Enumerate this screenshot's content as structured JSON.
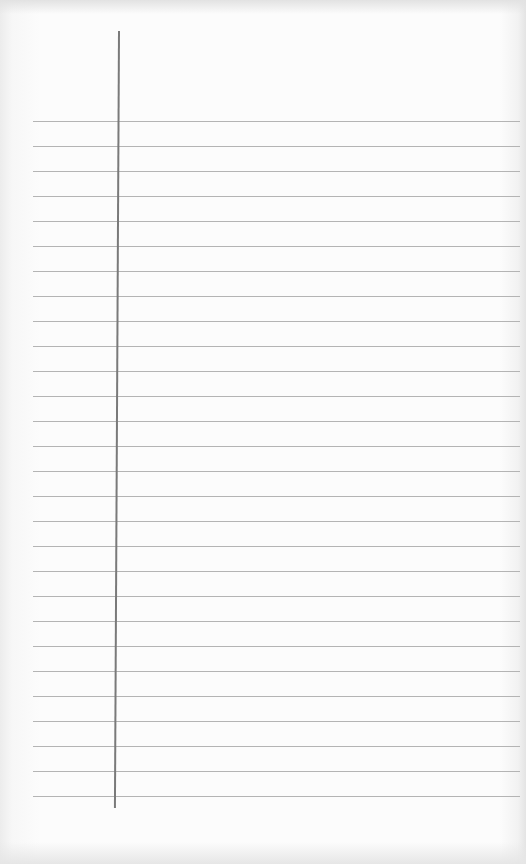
{
  "paper": {
    "type": "ruled-notebook-page",
    "rule_count": 28,
    "first_rule_y": 121,
    "rule_spacing": 25,
    "rule_color": "#b4b4b4",
    "margin_line_color": "#7a7a7a",
    "background_color": "#fcfcfc"
  }
}
